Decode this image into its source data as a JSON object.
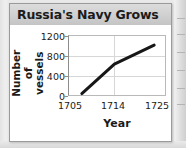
{
  "card": {
    "title": "Russia's Navy Grows"
  },
  "chart_data": {
    "type": "line",
    "title": "Russia's Navy Grows",
    "xlabel": "Year",
    "ylabel": "Number of\nvessels",
    "ylabel_lines": [
      "Number of",
      "vessels"
    ],
    "x": [
      1705,
      1714,
      1725
    ],
    "values": [
      30,
      650,
      1050
    ],
    "series": [
      {
        "name": "Number of vessels",
        "values": [
          30,
          650,
          1050
        ],
        "color": "#171717"
      }
    ],
    "xticks": [
      "1705",
      "1714",
      "1725"
    ],
    "xtick_values": [
      1705,
      1714,
      1725
    ],
    "yticks": [
      "0",
      "400",
      "800",
      "1200"
    ],
    "ytick_values": [
      0,
      400,
      800,
      1200
    ],
    "xlim": [
      1702,
      1728
    ],
    "ylim": [
      0,
      1200
    ],
    "grid": true,
    "grid_color": "#d7d7d7",
    "legend": "none",
    "frame_color": "#b9b9b9",
    "axis_color": "#8d8d8d"
  }
}
